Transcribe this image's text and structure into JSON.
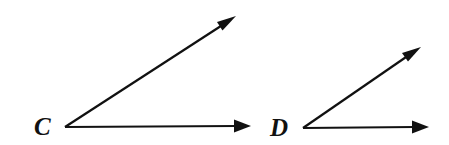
{
  "figure": {
    "type": "geometry-diagram",
    "background_color": "#ffffff",
    "stroke_color": "#111111",
    "canvas": {
      "width": 449,
      "height": 145
    },
    "angles": [
      {
        "id": "angle-c",
        "label": "C",
        "label_position": {
          "x": 34,
          "y": 135
        },
        "vertex": {
          "x": 65,
          "y": 127
        },
        "rays": [
          {
            "id": "ray-c-upper",
            "name": "upper-ray",
            "from": {
              "x": 65,
              "y": 127
            },
            "to": {
              "x": 236,
              "y": 16
            },
            "arrowhead": true
          },
          {
            "id": "ray-c-horizontal",
            "name": "horizontal-ray",
            "from": {
              "x": 65,
              "y": 127
            },
            "to": {
              "x": 251,
              "y": 126
            },
            "arrowhead": true
          }
        ],
        "measure_degrees": 33
      },
      {
        "id": "angle-d",
        "label": "D",
        "label_position": {
          "x": 270,
          "y": 136
        },
        "vertex": {
          "x": 303,
          "y": 128
        },
        "rays": [
          {
            "id": "ray-d-upper",
            "name": "upper-ray",
            "from": {
              "x": 303,
              "y": 128
            },
            "to": {
              "x": 421,
              "y": 47
            },
            "arrowhead": true
          },
          {
            "id": "ray-d-horizontal",
            "name": "horizontal-ray",
            "from": {
              "x": 303,
              "y": 128
            },
            "to": {
              "x": 429,
              "y": 127
            },
            "arrowhead": true
          }
        ],
        "measure_degrees": 34
      }
    ]
  }
}
